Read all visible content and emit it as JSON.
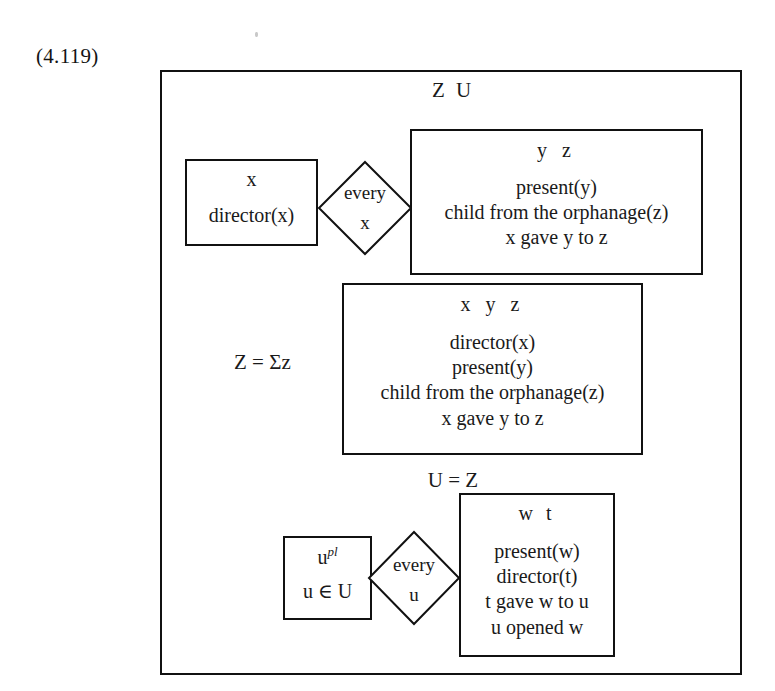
{
  "equation": {
    "number": "(4.119)"
  },
  "outer_drs": {
    "universe": "Z  U"
  },
  "row1": {
    "left_box": {
      "universe": "x",
      "conditions": [
        "director(x)"
      ]
    },
    "operator": {
      "quantifier": "every",
      "variable": "x"
    },
    "right_box": {
      "universe": "y  z",
      "conditions": [
        "present(y)",
        "child from the orphanage(z)",
        "x gave y to z"
      ]
    }
  },
  "row2": {
    "label": "Z = Σz",
    "box": {
      "universe": "x  y  z",
      "conditions": [
        "director(x)",
        "present(y)",
        "child from the orphanage(z)",
        "x gave y to z"
      ]
    }
  },
  "row3": {
    "label": "U = Z"
  },
  "row4": {
    "left_box": {
      "universe_base": "u",
      "universe_sup": "pl",
      "conditions": [
        "u ∈ U"
      ]
    },
    "operator": {
      "quantifier": "every",
      "variable": "u"
    },
    "right_box": {
      "universe": "w  t",
      "conditions": [
        "present(w)",
        "director(t)",
        "t gave w to u",
        "u opened w"
      ]
    }
  },
  "colors": {
    "ink": "#111111",
    "paper": "#ffffff"
  }
}
